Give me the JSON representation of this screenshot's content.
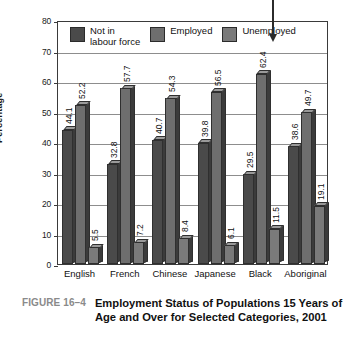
{
  "caption": {
    "figure_number": "FIGURE 16–4",
    "title": "Employment Status of Populations 15 Years of Age and Over for Selected Categories, 2001"
  },
  "annotation": {
    "arrow": "down-arrow-pointing-to-unemployed-legend"
  },
  "chart_data": {
    "type": "bar",
    "title": "Employment Status of Populations 15 Years of Age and Over for Selected Categories, 2001",
    "xlabel": "",
    "ylabel": "Percentage",
    "ylim": [
      0,
      80
    ],
    "yticks": [
      0,
      10,
      20,
      30,
      40,
      50,
      60,
      70,
      80
    ],
    "grid": true,
    "legend_position": "top-inside",
    "categories": [
      "English",
      "French",
      "Chinese",
      "Japanese",
      "Black",
      "Aboriginal"
    ],
    "series": [
      {
        "name": "Not in\nlabour force",
        "color": "#4a4a4a",
        "values": [
          44.1,
          32.8,
          40.7,
          39.8,
          29.5,
          38.6
        ]
      },
      {
        "name": "Employed",
        "color": "#6e6e6e",
        "values": [
          52.2,
          57.7,
          54.3,
          56.5,
          62.4,
          49.7
        ]
      },
      {
        "name": "Unemployed",
        "color": "#7a7a7a",
        "values": [
          5.5,
          7.2,
          8.4,
          6.1,
          11.5,
          19.1
        ]
      }
    ]
  }
}
